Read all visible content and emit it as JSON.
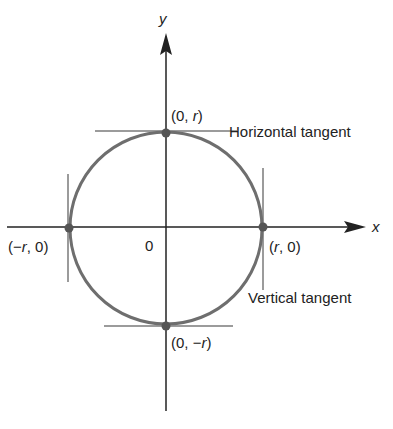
{
  "diagram": {
    "type": "circle-tangents",
    "axes": {
      "x_label": "x",
      "y_label": "y",
      "origin_label": "0"
    },
    "points": [
      {
        "id": "top",
        "label_pre": "(0, ",
        "label_var": "r",
        "label_post": ")"
      },
      {
        "id": "bottom",
        "label_pre": "(0, −",
        "label_var": "r",
        "label_post": ")"
      },
      {
        "id": "left",
        "label_pre": "(−",
        "label_var": "r",
        "label_post": ", 0)"
      },
      {
        "id": "right",
        "label_pre": "(",
        "label_var": "r",
        "label_post": ", 0)"
      }
    ],
    "annotations": {
      "horizontal": "Horizontal tangent",
      "vertical": "Vertical tangent"
    },
    "colors": {
      "axis": "#222222",
      "circle": "#6e6e6e",
      "tangent": "#7a7a7a",
      "point": "#555555"
    }
  }
}
